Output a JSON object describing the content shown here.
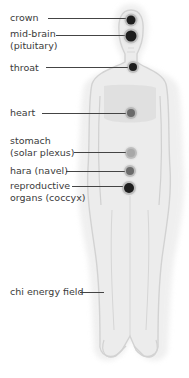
{
  "diagram": {
    "type": "chakra-energy-centers-body",
    "colors": {
      "dot_dark": "#1e1e1e",
      "dot_mid": "#6a6a6a",
      "dot_light": "#a8a8a8",
      "leader": "#444444",
      "body_fill": "#e6e6e6",
      "body_outline": "#cfcfcf",
      "text": "#3a3a3a"
    },
    "labels": [
      {
        "id": "crown",
        "lines": [
          "crown"
        ],
        "label_y": 12,
        "leader_y": 18,
        "leader_x1": 48,
        "dot": {
          "x": 131,
          "y": 20,
          "r": 4.5,
          "tone": "dark"
        }
      },
      {
        "id": "mid-brain",
        "lines": [
          "mid-brain",
          "(pituitary)"
        ],
        "label_y": 28,
        "leader_y": 35,
        "leader_x1": 56,
        "dot": {
          "x": 131,
          "y": 36,
          "r": 5.5,
          "tone": "dark"
        }
      },
      {
        "id": "throat",
        "lines": [
          "throat"
        ],
        "label_y": 62,
        "leader_y": 67,
        "leader_x1": 46,
        "dot": {
          "x": 133,
          "y": 67,
          "r": 4,
          "tone": "dark"
        }
      },
      {
        "id": "heart",
        "lines": [
          "heart"
        ],
        "label_y": 107,
        "leader_y": 113,
        "leader_x1": 42,
        "dot": {
          "x": 131,
          "y": 113,
          "r": 4,
          "tone": "mid"
        }
      },
      {
        "id": "stomach",
        "lines": [
          "stomach",
          "(solar plexus)"
        ],
        "label_y": 135,
        "leader_y": 152,
        "leader_x1": 74,
        "dot": {
          "x": 131,
          "y": 153,
          "r": 4,
          "tone": "light"
        }
      },
      {
        "id": "hara",
        "lines": [
          "hara (navel)"
        ],
        "label_y": 165,
        "leader_y": 171,
        "leader_x1": 66,
        "dot": {
          "x": 130,
          "y": 171,
          "r": 4,
          "tone": "mid"
        }
      },
      {
        "id": "reproductive",
        "lines": [
          "reproductive",
          "organs (coccyx)"
        ],
        "label_y": 180,
        "leader_y": 186,
        "leader_x1": 72,
        "dot": {
          "x": 129,
          "y": 188,
          "r": 5,
          "tone": "dark"
        }
      },
      {
        "id": "chi-energy-field",
        "lines": [
          "chi energy field"
        ],
        "label_y": 286,
        "leader_y": 292,
        "leader_x1": 80,
        "leader_x2": 104,
        "dot": null
      }
    ]
  }
}
